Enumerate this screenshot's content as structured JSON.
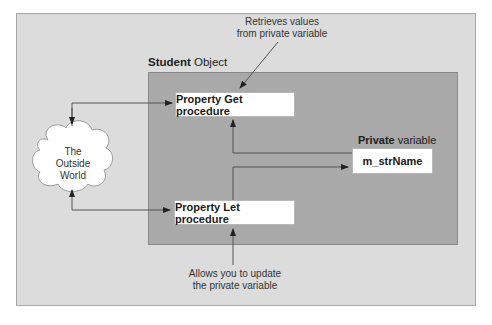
{
  "diagram": {
    "object_label": {
      "bold": "Student",
      "rest": " Object"
    },
    "private_label": {
      "bold": "Private",
      "rest": " variable"
    },
    "nodes": {
      "get_procedure": "Property Get procedure",
      "let_procedure": "Property Let procedure",
      "private_variable": "m_strName",
      "outside_world": [
        "The",
        "Outside",
        "World"
      ]
    },
    "annotations": {
      "get_note": [
        "Retrieves values",
        "from private variable"
      ],
      "let_note": [
        "Allows you to update",
        "the private variable"
      ]
    },
    "colors": {
      "outer_panel": "#dcdcdc",
      "inner_panel": "#a9a9a9",
      "box": "#ffffff",
      "line": "#555555"
    }
  }
}
